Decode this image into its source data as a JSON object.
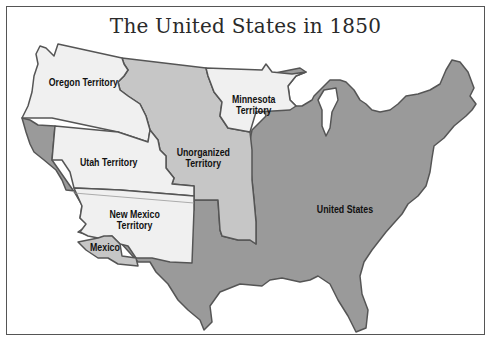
{
  "title": "The United States in 1850",
  "regions": [
    {
      "name": "Oregon Territory",
      "label_lines": [
        "Oregon Territory"
      ],
      "color": "#f0f0f0"
    },
    {
      "name": "Minnesota Territory",
      "label_lines": [
        "Minnesota",
        "Territory"
      ],
      "color": "#f0f0f0"
    },
    {
      "name": "Unorganized Territory",
      "label_lines": [
        "Unorganized",
        "Territory"
      ],
      "color": "#c6c6c6"
    },
    {
      "name": "Utah Territory",
      "label_lines": [
        "Utah Territory"
      ],
      "color": "#f0f0f0"
    },
    {
      "name": "New Mexico Territory",
      "label_lines": [
        "New Mexico",
        "Territory"
      ],
      "color": "#f0f0f0"
    },
    {
      "name": "Mexico",
      "label_lines": [
        "Mexico"
      ],
      "color": "#c6c6c6"
    },
    {
      "name": "United States",
      "label_lines": [
        "United States"
      ],
      "color": "#9a9a9a"
    }
  ],
  "colors": {
    "territory": "#f0f0f0",
    "unorganized": "#c6c6c6",
    "states": "#9a9a9a",
    "border": "#555555",
    "background": "#ffffff"
  }
}
